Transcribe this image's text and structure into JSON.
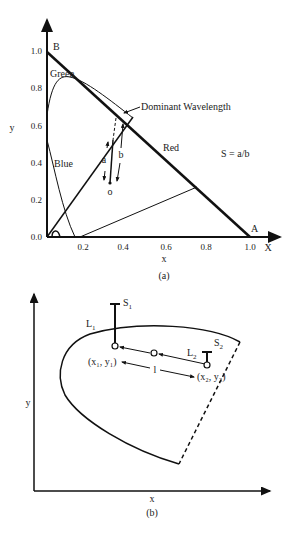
{
  "panel_a": {
    "caption": "(a)",
    "x_axis_label": "x",
    "y_axis_label": "y",
    "x_end_label": "X",
    "x_ticks": [
      "0.0",
      "0.2",
      "0.4",
      "0.6",
      "0.8",
      "1.0"
    ],
    "y_ticks": [
      "0.0",
      "0.2",
      "0.4",
      "0.6",
      "0.8",
      "1.0"
    ],
    "point_B": "B",
    "point_A": "A",
    "label_green": "Green",
    "label_blue": "Blue",
    "label_red": "Red",
    "label_dominant": "Dominant Wavelength",
    "label_a": "a",
    "label_b": "b",
    "label_o": "o",
    "formula": "S = a/b"
  },
  "panel_b": {
    "caption": "(b)",
    "x_axis_label": "x",
    "y_axis_label": "y",
    "label_S1": "S",
    "label_S1_sub": "1",
    "label_S2": "S",
    "label_S2_sub": "2",
    "label_L1": "L",
    "label_L1_sub": "1",
    "label_L2": "L",
    "label_L2_sub": "2",
    "label_p1": "(x₁, y₁)",
    "label_p2": "(x₂, y₂)",
    "label_l": "l"
  }
}
